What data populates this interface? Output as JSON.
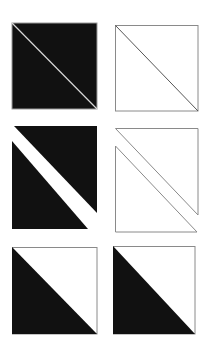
{
  "diagram": {
    "colors": {
      "fill_dark": "#111111",
      "outline": "#8a8a8a",
      "gap": "#ffffff",
      "background": "#ffffff"
    },
    "rows": [
      {
        "name": "row-joined",
        "cells": [
          {
            "name": "filled-square-thin-diagonal",
            "style": "both triangles filled black, separated by a thin light diagonal line",
            "upper_triangle": [
              [
                12,
                23
              ],
              [
                97,
                23
              ],
              [
                97,
                109
              ]
            ],
            "lower_triangle": [
              [
                12,
                23
              ],
              [
                97,
                109
              ],
              [
                12,
                109
              ]
            ],
            "upper_fill": "dark",
            "lower_fill": "dark",
            "diagonal": "thin-light"
          },
          {
            "name": "outline-square-diagonal",
            "style": "outlined square with a diagonal line",
            "upper_triangle": [
              [
                115,
                25
              ],
              [
                198,
                25
              ],
              [
                198,
                111
              ]
            ],
            "lower_triangle": [
              [
                115,
                25
              ],
              [
                198,
                111
              ],
              [
                115,
                111
              ]
            ],
            "upper_fill": "none",
            "lower_fill": "none",
            "diagonal": "outline"
          }
        ]
      },
      {
        "name": "row-separated",
        "cells": [
          {
            "name": "filled-triangles-separated",
            "style": "two black triangles separated by a wide white diagonal band",
            "upper_triangle": [
              [
                20,
                126
              ],
              [
                97,
                126
              ],
              [
                97,
                213
              ]
            ],
            "lower_triangle": [
              [
                12,
                141
              ],
              [
                88,
                229
              ],
              [
                12,
                229
              ]
            ],
            "upper_fill": "dark",
            "lower_fill": "dark",
            "diagonal": "wide-gap"
          },
          {
            "name": "outline-triangles-separated",
            "style": "two outlined triangles separated by a narrow diagonal gap",
            "upper_triangle": [
              [
                115,
                128
              ],
              [
                198,
                128
              ],
              [
                198,
                215
              ]
            ],
            "lower_triangle": [
              [
                115,
                146
              ],
              [
                197,
                232
              ],
              [
                115,
                232
              ]
            ],
            "upper_fill": "none",
            "lower_fill": "none",
            "diagonal": "narrow-gap"
          }
        ]
      },
      {
        "name": "row-half-filled",
        "cells": [
          {
            "name": "half-filled-square-left",
            "style": "square with lower-left triangle filled black, upper-right white with outline",
            "upper_triangle": [
              [
                12,
                247
              ],
              [
                97,
                247
              ],
              [
                97,
                334
              ]
            ],
            "lower_triangle": [
              [
                12,
                247
              ],
              [
                97,
                334
              ],
              [
                12,
                334
              ]
            ],
            "upper_fill": "none",
            "lower_fill": "dark",
            "diagonal": "edge"
          },
          {
            "name": "half-filled-square-right",
            "style": "square with lower-left triangle filled black, upper-right white with outline",
            "upper_triangle": [
              [
                113,
                246
              ],
              [
                195,
                246
              ],
              [
                195,
                334
              ]
            ],
            "lower_triangle": [
              [
                113,
                246
              ],
              [
                195,
                334
              ],
              [
                113,
                334
              ]
            ],
            "upper_fill": "none",
            "lower_fill": "dark",
            "diagonal": "edge"
          }
        ]
      }
    ]
  }
}
